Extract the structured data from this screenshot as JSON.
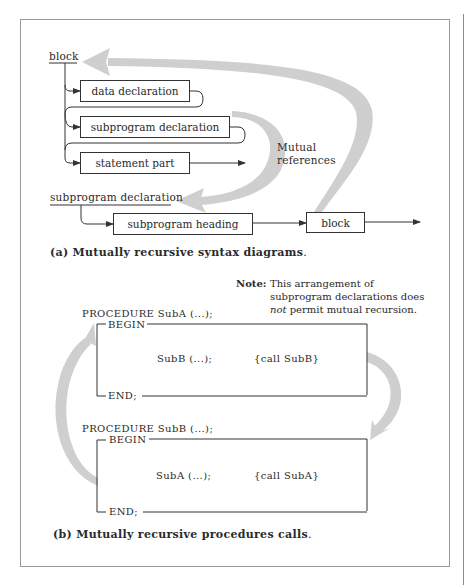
{
  "figure_a": {
    "block_label": "block",
    "boxes": {
      "data_declaration": "data declaration",
      "subprogram_declaration": "subprogram declaration",
      "statement_part": "statement part"
    },
    "mutual_references": [
      "Mutual",
      "references"
    ],
    "subprogram_declaration_label": "subprogram declaration",
    "subprogram_heading": "subprogram heading",
    "block_box": "block",
    "caption_prefix": "(a)",
    "caption_text": "Mutually recursive syntax diagrams",
    "caption_tail": "."
  },
  "figure_b": {
    "note_key": "Note:",
    "note_lines": [
      "This arrangement of",
      "subprogram declarations does"
    ],
    "note_line3_italic": "not",
    "note_line3_rest": " permit mutual recursion.",
    "proc_a": {
      "header": "PROCEDURE SubA (...);",
      "begin": "BEGIN",
      "call": "SubB (...);",
      "comment": "{call SubB}",
      "end": "END;"
    },
    "proc_b": {
      "header": "PROCEDURE SubB (...);",
      "begin": "BEGIN",
      "call": "SubA (...);",
      "comment": "{call SubA}",
      "end": "END;"
    },
    "caption_prefix": "(b)",
    "caption_text": "Mutually recursive procedures calls",
    "caption_tail": "."
  },
  "colors": {
    "line": "#333333",
    "arrow_band": "#cfcfcf",
    "frame": "#9a9a9a"
  }
}
